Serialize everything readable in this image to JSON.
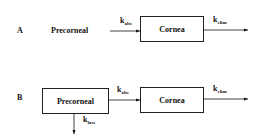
{
  "panel_a": {
    "label": "A",
    "source": "Precorneal",
    "target": "Cornea",
    "k_abs": {
      "base": "k",
      "sub": "abs"
    },
    "k_elim": {
      "base": "k",
      "sub": "elim"
    }
  },
  "panel_b": {
    "label": "B",
    "source": "Precorneal",
    "target": "Cornea",
    "k_abs": {
      "base": "k",
      "sub": "abs"
    },
    "k_elim": {
      "base": "k",
      "sub": "elim"
    },
    "k_loss": {
      "base": "k",
      "sub": "loss"
    }
  }
}
